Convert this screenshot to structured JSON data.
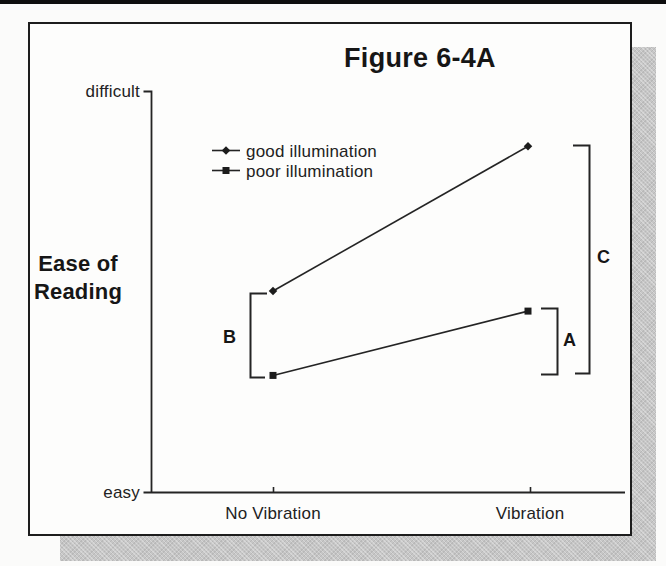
{
  "figure": {
    "title": "Figure 6-4A"
  },
  "axes": {
    "y_label_line1": "Ease of",
    "y_label_line2": "Reading",
    "y_top_tick": "difficult",
    "y_bottom_tick": "easy",
    "x_categories": [
      "No Vibration",
      "Vibration"
    ]
  },
  "legend": {
    "items": [
      {
        "label": "good illumination",
        "marker": "diamond"
      },
      {
        "label": "poor illumination",
        "marker": "square"
      }
    ]
  },
  "annotations": {
    "bracket_b": "B",
    "bracket_a": "A",
    "bracket_c": "C"
  },
  "chart_data": {
    "type": "line",
    "title": "Figure 6-4A",
    "categories": [
      "No Vibration",
      "Vibration"
    ],
    "series": [
      {
        "name": "good illumination",
        "marker": "diamond",
        "values": [
          0.5,
          0.86
        ]
      },
      {
        "name": "poor illumination",
        "marker": "square",
        "values": [
          0.29,
          0.45
        ]
      }
    ],
    "xlabel": "",
    "ylabel": "Ease of Reading",
    "y_axis_qualitative_labels": [
      "easy",
      "difficult"
    ],
    "ylim": [
      0,
      1
    ],
    "grid": false,
    "legend_position": "upper-left",
    "annotations": [
      {
        "label": "B",
        "at": "No Vibration",
        "spans": "gap between good and poor illumination points"
      },
      {
        "label": "A",
        "at": "Vibration",
        "spans": "gap below poor illumination point"
      },
      {
        "label": "C",
        "at": "Vibration",
        "spans": "gap from good illumination point down to lower level"
      }
    ]
  },
  "colors": {
    "ink": "#242424",
    "paper": "#fdfdfc",
    "shadow": "#c6c6c6"
  }
}
